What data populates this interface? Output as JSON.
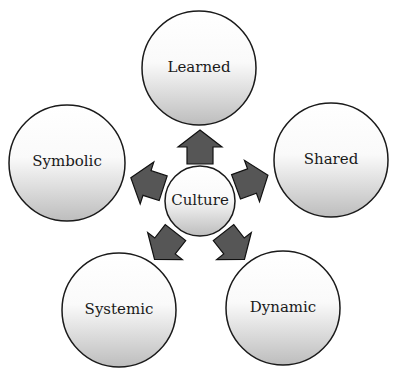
{
  "diagram": {
    "type": "radial-hub-and-spoke",
    "center": {
      "id": "culture",
      "label": "Culture"
    },
    "nodes": [
      {
        "id": "learned",
        "label": "Learned"
      },
      {
        "id": "shared",
        "label": "Shared"
      },
      {
        "id": "dynamic",
        "label": "Dynamic"
      },
      {
        "id": "systemic",
        "label": "Systemic"
      },
      {
        "id": "symbolic",
        "label": "Symbolic"
      }
    ],
    "edges": [
      {
        "from": "culture",
        "to": "learned",
        "style": "block-arrow"
      },
      {
        "from": "culture",
        "to": "shared",
        "style": "block-arrow"
      },
      {
        "from": "culture",
        "to": "dynamic",
        "style": "block-arrow"
      },
      {
        "from": "culture",
        "to": "systemic",
        "style": "block-arrow"
      },
      {
        "from": "culture",
        "to": "symbolic",
        "style": "block-arrow"
      }
    ],
    "colors": {
      "circle_top": "#ffffff",
      "circle_bottom": "#c4c4c4",
      "circle_stroke": "#1a1a1a",
      "arrow_fill": "#555555",
      "arrow_stroke": "#111111",
      "text": "#1a1a1a"
    }
  }
}
